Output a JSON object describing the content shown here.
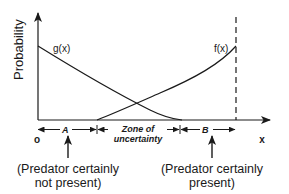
{
  "diagram": {
    "y_axis_label": "Probability",
    "x_axis_label": "x",
    "origin_label": "o",
    "curves": [
      {
        "name": "g",
        "label": "g(x)",
        "description": "decreasing curve — predator not present"
      },
      {
        "name": "f",
        "label": "f(x)",
        "description": "increasing curve — predator present"
      }
    ],
    "zones": [
      {
        "label": "A"
      },
      {
        "label_line1": "Zone of",
        "label_line2": "uncertainty"
      },
      {
        "label": "B"
      }
    ],
    "annotations": [
      {
        "line1": "(Predator certainly",
        "line2": "not present)",
        "points_to": "A"
      },
      {
        "line1": "(Predator certainly",
        "line2": "present)",
        "points_to": "B"
      }
    ],
    "colors": {
      "ink": "#1a1a1a",
      "background": "#ffffff"
    }
  }
}
